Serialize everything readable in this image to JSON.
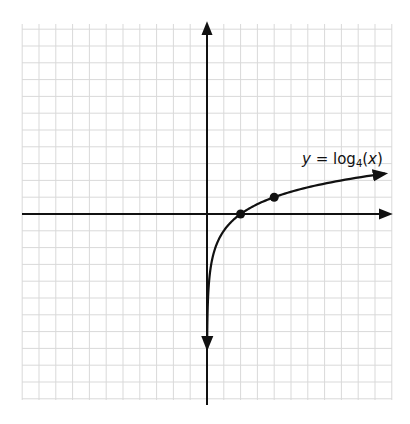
{
  "chart_data": {
    "type": "line",
    "title": "",
    "function": "y = log4(x)",
    "annotation": {
      "prefix": "y = log",
      "base": "4",
      "arg": "(x)"
    },
    "xlabel": "",
    "ylabel": "",
    "grid": true,
    "grid_step": 0.5,
    "xlim": [
      -5.5,
      5.5
    ],
    "ylim": [
      -5.5,
      5.5
    ],
    "tick_labels": [],
    "marked_points": [
      {
        "x": 1,
        "y": 0
      },
      {
        "x": 2,
        "y": 0.5
      }
    ],
    "series": [
      {
        "name": "log4(x)",
        "x": [
          0.01,
          0.05,
          0.1,
          0.25,
          0.5,
          1,
          2,
          3,
          4,
          5.4
        ],
        "values": [
          -3.32,
          -2.16,
          -1.66,
          -1.0,
          -0.5,
          0,
          0.5,
          0.79,
          1.0,
          1.22
        ]
      }
    ]
  },
  "colors": {
    "grid": "#d9d9d9",
    "axis": "#111111",
    "curve": "#111111",
    "background": "#ffffff"
  }
}
